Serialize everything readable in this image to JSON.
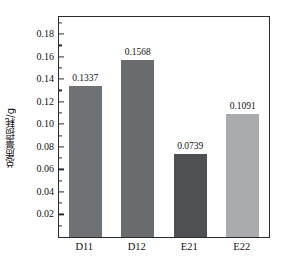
{
  "chart_data": {
    "type": "bar",
    "title": "",
    "xlabel": "",
    "ylabel": "总质量损耗/g",
    "categories": [
      "D11",
      "D12",
      "E21",
      "E22"
    ],
    "values": [
      0.1337,
      0.1568,
      0.0739,
      0.1091
    ],
    "value_labels": [
      "0.1337",
      "0.1568",
      "0.0739",
      "0.1091"
    ],
    "bar_colors": [
      "#6f7173",
      "#696b6d",
      "#4e5052",
      "#a9abad"
    ],
    "ylim": [
      0,
      0.1952
    ],
    "ytick_values": [
      0.02,
      0.04,
      0.06,
      0.08,
      0.1,
      0.12,
      0.14,
      0.16,
      0.18
    ],
    "ytick_labels": [
      "0.02",
      "0.04",
      "0.06",
      "0.08",
      "0.10",
      "0.12",
      "0.14",
      "0.16",
      "0.18"
    ],
    "minor_ticks": [
      0.01,
      0.03,
      0.05,
      0.07,
      0.09,
      0.11,
      0.13,
      0.15,
      0.17,
      0.19
    ],
    "grid": false,
    "legend": null,
    "frame": true,
    "axis_color": "#2b2b2b",
    "background": "#ffffff"
  }
}
